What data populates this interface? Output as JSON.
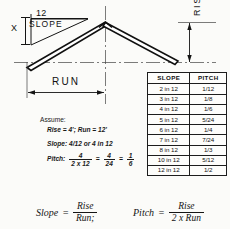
{
  "diagram": {
    "slope_triangle": {
      "top_label": "12",
      "side_label": "X",
      "inner_label": "SLOPE"
    },
    "run_label": "RUN",
    "rise_label": "RISE"
  },
  "assume": {
    "heading": "Assume:",
    "line_rise_run": "Rise = 4'; Run = 12'",
    "line_slope": "Slope: 4/12 or 4 in 12",
    "pitch_label": "Pitch:",
    "pitch_frac1_num": "4",
    "pitch_frac1_den": "2 x 12",
    "equals1": "=",
    "pitch_frac2_num": "4",
    "pitch_frac2_den": "24",
    "equals2": "=",
    "pitch_frac3_num": "1",
    "pitch_frac3_den": "6"
  },
  "table": {
    "headers": [
      "SLOPE",
      "PITCH"
    ],
    "rows": [
      {
        "slope": "2 in 12",
        "pitch": "1/12"
      },
      {
        "slope": "3 in 12",
        "pitch": "1/8"
      },
      {
        "slope": "4 in 12",
        "pitch": "1/6"
      },
      {
        "slope": "5 in 12",
        "pitch": "5/24"
      },
      {
        "slope": "6 in 12",
        "pitch": "1/4"
      },
      {
        "slope": "7 in 12",
        "pitch": "7/24"
      },
      {
        "slope": "8 in 12",
        "pitch": "1/3"
      },
      {
        "slope": "10 in 12",
        "pitch": "5/12"
      },
      {
        "slope": "12 in 12",
        "pitch": "1/2"
      }
    ]
  },
  "formulas": {
    "slope": {
      "name": "Slope",
      "equals": "=",
      "numerator": "Rise",
      "denominator": "Run;"
    },
    "pitch": {
      "name": "Pitch",
      "equals": "=",
      "numerator": "Rise",
      "denominator": "2 x Run"
    }
  },
  "colors": {
    "ink": "#141414",
    "paper": "#fbfbf9"
  }
}
